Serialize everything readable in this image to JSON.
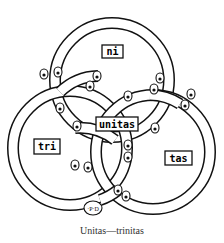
{
  "diagram": {
    "title": "Unitas—trinitas",
    "style": "woodcut line drawing, three interlaced rings",
    "colors": {
      "ink": "#111111",
      "paper": "#ffffff",
      "caption": "#333333"
    },
    "rings": [
      {
        "id": "top",
        "cx": 112,
        "cy": 80,
        "r": 57,
        "label": "ni"
      },
      {
        "id": "left",
        "cx": 70,
        "cy": 148,
        "r": 57,
        "label": "tri"
      },
      {
        "id": "right",
        "cx": 153,
        "cy": 152,
        "r": 57,
        "label": "tas"
      }
    ],
    "labels": {
      "top": "ni",
      "left": "tri",
      "right": "tas",
      "center": "unitas",
      "monogram": "·P·D"
    },
    "caption": "Unitas—trinitas"
  }
}
